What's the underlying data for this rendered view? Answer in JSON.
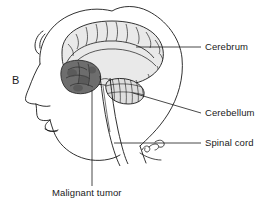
{
  "figure": {
    "panel_label": "B",
    "type": "medical-anatomical-illustration",
    "background_color": "#ffffff",
    "line_color": "#1a1a1a"
  },
  "labels": {
    "cerebrum": "Cerebrum",
    "cerebellum": "Cerebellum",
    "spinal_cord": "Spinal cord",
    "malignant_tumor": "Malignant tumor"
  },
  "structures": [
    {
      "name": "head-profile",
      "label": "",
      "fill": "#ffffff",
      "stroke": "#1a1a1a"
    },
    {
      "name": "cerebrum",
      "label": "Cerebrum",
      "fill": "#e8e8e8",
      "stroke": "#1a1a1a"
    },
    {
      "name": "cerebellum",
      "label": "Cerebellum",
      "fill": "#dcdcdc",
      "stroke": "#1a1a1a"
    },
    {
      "name": "brainstem-spinal-cord",
      "label": "Spinal cord",
      "fill": "#f2f2f2",
      "stroke": "#1a1a1a"
    },
    {
      "name": "malignant-tumor",
      "label": "Malignant tumor",
      "fill": "#6b6b6b",
      "stroke": "#2a2a2a"
    }
  ],
  "leader_lines": [
    {
      "name": "leader-cerebrum",
      "from": [
        136,
        47
      ],
      "to": [
        201,
        47
      ]
    },
    {
      "name": "leader-cerebellum",
      "from": [
        133,
        93
      ],
      "to": [
        201,
        113
      ]
    },
    {
      "name": "leader-spinal-cord",
      "from": [
        114,
        143
      ],
      "to": [
        201,
        143
      ]
    },
    {
      "name": "leader-malignant-tumor",
      "from": [
        92,
        90
      ],
      "to": [
        92,
        186
      ]
    }
  ]
}
